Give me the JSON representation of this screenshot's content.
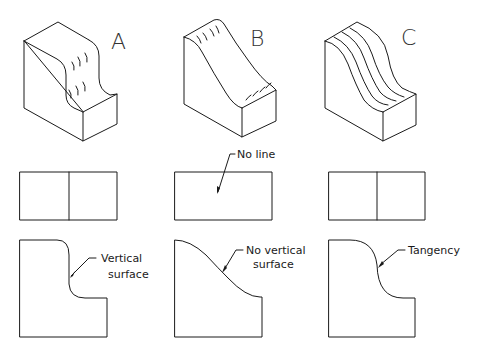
{
  "figure": {
    "type": "technical-drawing",
    "columns": [
      {
        "id": "A",
        "label": "A",
        "top_view": {
          "divider_line": true
        },
        "front_view": {
          "callout": [
            "Vertical",
            "surface"
          ]
        }
      },
      {
        "id": "B",
        "label": "B",
        "top_view": {
          "divider_line": false,
          "callout": "No line"
        },
        "front_view": {
          "callout": [
            "No vertical",
            "surface"
          ]
        }
      },
      {
        "id": "C",
        "label": "C",
        "top_view": {
          "divider_line": true
        },
        "front_view": {
          "callout": [
            "Tangency"
          ]
        }
      }
    ]
  },
  "colors": {
    "line": "#1a1a1a",
    "background": "#ffffff"
  }
}
